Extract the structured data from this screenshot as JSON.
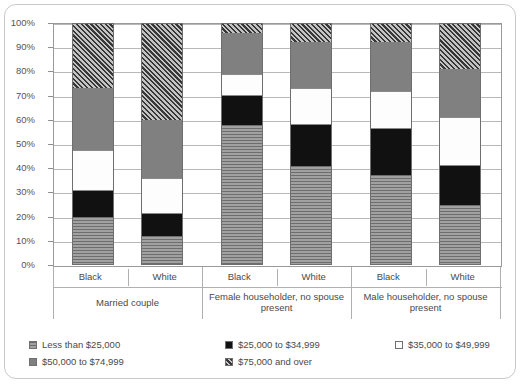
{
  "chart_data": {
    "type": "bar",
    "subtype": "stacked-percent",
    "title": "",
    "xlabel": "",
    "ylabel": "",
    "ylim": [
      0,
      100
    ],
    "ytick_labels": [
      "0%",
      "10%",
      "20%",
      "30%",
      "40%",
      "50%",
      "60%",
      "70%",
      "80%",
      "90%",
      "100%"
    ],
    "ytick_values": [
      0,
      10,
      20,
      30,
      40,
      50,
      60,
      70,
      80,
      90,
      100
    ],
    "grid": true,
    "legend_position": "bottom",
    "categories": [
      "Black",
      "White",
      "Black",
      "White",
      "Black",
      "White"
    ],
    "group_labels": [
      "Married couple",
      "Female householder, no spouse present",
      "Male householder, no spouse present"
    ],
    "series": [
      {
        "name": "Less than $25,000",
        "values": [
          20.0,
          12.0,
          58.0,
          41.0,
          37.0,
          25.0
        ]
      },
      {
        "name": "$25,000 to $34,999",
        "values": [
          10.5,
          9.0,
          12.0,
          17.0,
          19.0,
          16.0
        ]
      },
      {
        "name": "$35,000 to $49,999",
        "values": [
          17.0,
          15.0,
          9.0,
          15.0,
          16.0,
          20.0
        ]
      },
      {
        "name": "$50,000 to $74,999",
        "values": [
          25.5,
          24.0,
          17.0,
          19.0,
          20.0,
          20.0
        ]
      },
      {
        "name": "$75,000 and over",
        "values": [
          27.0,
          40.0,
          4.0,
          8.0,
          8.0,
          19.0
        ]
      }
    ]
  },
  "legend": {
    "items": [
      {
        "label": "Less than $25,000",
        "swatch": "striped-gray-swatch"
      },
      {
        "label": "$25,000 to $34,999",
        "swatch": "solid-black-swatch"
      },
      {
        "label": "$35,000 to $49,999",
        "swatch": "white-swatch"
      },
      {
        "label": "$50,000 to $74,999",
        "swatch": "solid-gray-swatch"
      },
      {
        "label": "$75,000 and over",
        "swatch": "hatched-gray-swatch"
      }
    ]
  }
}
